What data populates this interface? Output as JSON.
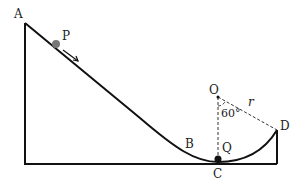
{
  "labels": {
    "A": "A",
    "P": "P",
    "B": "B",
    "C": "C",
    "Q": "Q",
    "O": "O",
    "D": "D",
    "r": "r",
    "angle": "60°"
  }
}
